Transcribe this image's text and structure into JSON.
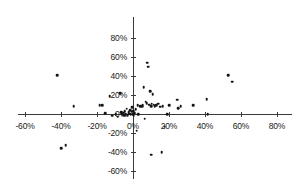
{
  "chart_data": {
    "type": "scatter",
    "title": "",
    "subtitle": "",
    "xlabel": "",
    "ylabel": "",
    "xlim": [
      -0.6,
      0.8
    ],
    "ylim": [
      -0.6,
      0.8
    ],
    "grid": false,
    "legend": null,
    "axis_style": "crossed-at-origin",
    "tick_format": "percent",
    "xticks": [
      -0.6,
      -0.4,
      -0.2,
      0.0,
      0.2,
      0.4,
      0.6,
      0.8
    ],
    "yticks": [
      -0.6,
      -0.4,
      -0.2,
      0.0,
      0.2,
      0.4,
      0.6,
      0.8
    ],
    "xtick_labels": [
      "-60%",
      "-40%",
      "-20%",
      "0%",
      "20%",
      "40%",
      "60%",
      "80%"
    ],
    "ytick_labels": [
      "-60%",
      "-40%",
      "-20%",
      "0%",
      "20%",
      "40%",
      "60%",
      "80%"
    ],
    "marker": {
      "shape": "dot",
      "color": "#151515",
      "size": 2.6
    },
    "axis_color": "#3a3a3a",
    "background_color": "#ffffff",
    "points": [
      [
        -0.42,
        0.41
      ],
      [
        -0.33,
        0.08
      ],
      [
        -0.4,
        -0.36
      ],
      [
        -0.375,
        -0.33
      ],
      [
        -0.185,
        0.09
      ],
      [
        -0.17,
        0.09
      ],
      [
        -0.155,
        0.01
      ],
      [
        -0.13,
        0.19
      ],
      [
        -0.115,
        -0.02
      ],
      [
        -0.095,
        0.0
      ],
      [
        -0.085,
        -0.03
      ],
      [
        -0.07,
        0.22
      ],
      [
        -0.065,
        0.02
      ],
      [
        -0.06,
        0.0
      ],
      [
        -0.055,
        0.015
      ],
      [
        -0.05,
        -0.01
      ],
      [
        -0.045,
        0.03
      ],
      [
        -0.04,
        0.0
      ],
      [
        -0.035,
        0.055
      ],
      [
        -0.03,
        -0.015
      ],
      [
        -0.025,
        0.02
      ],
      [
        -0.02,
        0.005
      ],
      [
        -0.015,
        0.04
      ],
      [
        -0.012,
        -0.005
      ],
      [
        -0.008,
        0.025
      ],
      [
        -0.005,
        0.07
      ],
      [
        -0.002,
        0.0
      ],
      [
        0.0,
        0.03
      ],
      [
        0.005,
        -0.02
      ],
      [
        0.01,
        0.01
      ],
      [
        0.015,
        0.05
      ],
      [
        0.02,
        -0.175
      ],
      [
        0.025,
        0.09
      ],
      [
        0.03,
        0.0
      ],
      [
        0.04,
        0.08
      ],
      [
        0.05,
        0.085
      ],
      [
        0.055,
        0.1
      ],
      [
        0.06,
        0.28
      ],
      [
        0.065,
        -0.05
      ],
      [
        0.07,
        0.13
      ],
      [
        0.075,
        0.115
      ],
      [
        0.08,
        0.54
      ],
      [
        0.085,
        0.5
      ],
      [
        0.09,
        0.1
      ],
      [
        0.095,
        0.24
      ],
      [
        0.1,
        0.08
      ],
      [
        0.1,
        -0.43
      ],
      [
        0.105,
        0.11
      ],
      [
        0.11,
        0.21
      ],
      [
        0.115,
        0.1
      ],
      [
        0.12,
        0.085
      ],
      [
        0.13,
        0.095
      ],
      [
        0.14,
        0.11
      ],
      [
        0.15,
        0.075
      ],
      [
        0.16,
        -0.4
      ],
      [
        0.165,
        0.085
      ],
      [
        0.175,
        -0.135
      ],
      [
        0.19,
        0.0
      ],
      [
        0.2,
        0.09
      ],
      [
        0.245,
        0.15
      ],
      [
        0.25,
        0.06
      ],
      [
        0.265,
        0.085
      ],
      [
        0.335,
        0.095
      ],
      [
        0.41,
        0.155
      ],
      [
        0.415,
        0.0
      ],
      [
        0.53,
        0.41
      ],
      [
        0.55,
        0.34
      ]
    ]
  },
  "geometry": {
    "origin_x_px": 133,
    "origin_y_px": 114,
    "px_per_unit_x": 180,
    "px_per_unit_y": 95,
    "x_axis_start_px": 18,
    "x_axis_end_px": 292,
    "y_axis_top_px": 17,
    "y_axis_bottom_px": 179
  }
}
